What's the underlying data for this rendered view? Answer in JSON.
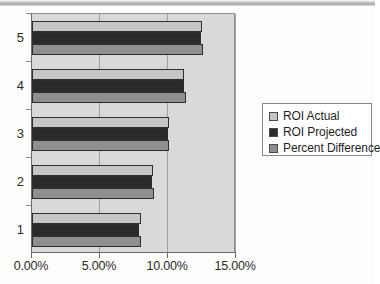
{
  "chart_data": {
    "type": "bar",
    "orientation": "horizontal",
    "title": "",
    "xlabel": "",
    "ylabel": "",
    "categories": [
      "1",
      "2",
      "3",
      "4",
      "5"
    ],
    "series": [
      {
        "name": "ROI Actual",
        "color": "#c6c6c6",
        "values": [
          8.0,
          8.9,
          10.1,
          11.2,
          12.5
        ]
      },
      {
        "name": "ROI Projected",
        "color": "#2b2b2b",
        "values": [
          7.9,
          8.8,
          10.0,
          11.2,
          12.4
        ]
      },
      {
        "name": "Percent Difference",
        "color": "#8f8f8f",
        "values": [
          8.0,
          9.0,
          10.1,
          11.3,
          12.6
        ]
      }
    ],
    "xlim": [
      0,
      15
    ],
    "x_ticks": [
      0,
      5,
      10,
      15
    ],
    "x_tick_labels": [
      "0.00%",
      "5.00%",
      "10.00%",
      "15.00%"
    ],
    "y_tick_labels": [
      "1",
      "2",
      "3",
      "4",
      "5"
    ],
    "grid": true,
    "grid_axis": "x",
    "legend_position": "right",
    "plot_background": "#d9d9d9"
  },
  "legend": {
    "items": [
      {
        "label": "ROI Actual"
      },
      {
        "label": "ROI Projected"
      },
      {
        "label": "Percent Difference"
      }
    ]
  }
}
